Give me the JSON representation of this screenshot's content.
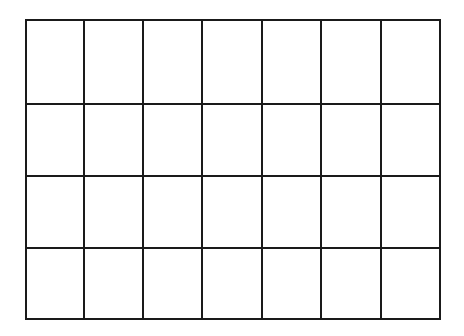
{
  "grid": {
    "rows": 4,
    "columns": 7,
    "line_color": "#1a1a1a",
    "background": "#ffffff",
    "x_lines": [
      26,
      84,
      143,
      202,
      262,
      321,
      381,
      440
    ],
    "y_lines": [
      20,
      104,
      176,
      248,
      319
    ]
  }
}
